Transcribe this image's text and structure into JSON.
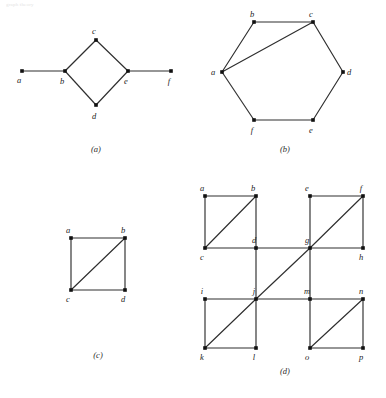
{
  "page": {
    "top_text": "graph theory",
    "background": "#ffffff",
    "edge_color": "#2e2e2e",
    "vertex_color": "#111111",
    "label_color": "#222222"
  },
  "figures": [
    {
      "id": "figure-a",
      "caption": "(a)",
      "type": "undirected-graph",
      "description": "path a-b, diamond b-c-e-d-b, path e-f",
      "vertices": [
        {
          "id": "a",
          "label": "a",
          "x": 22,
          "y": 71,
          "label_dx": -3,
          "label_dy": 12
        },
        {
          "id": "b",
          "label": "b",
          "x": 65,
          "y": 71,
          "label_dx": -3,
          "label_dy": 13
        },
        {
          "id": "c",
          "label": "c",
          "x": 96,
          "y": 40,
          "label_dx": -2,
          "label_dy": -6
        },
        {
          "id": "d",
          "label": "d",
          "x": 96,
          "y": 105,
          "label_dx": -2,
          "label_dy": 14
        },
        {
          "id": "e",
          "label": "e",
          "x": 128,
          "y": 71,
          "label_dx": -2,
          "label_dy": 13
        },
        {
          "id": "f",
          "label": "f",
          "x": 171,
          "y": 71,
          "label_dx": -2,
          "label_dy": 13
        }
      ],
      "edges": [
        [
          "a",
          "b"
        ],
        [
          "b",
          "c"
        ],
        [
          "c",
          "e"
        ],
        [
          "e",
          "d"
        ],
        [
          "d",
          "b"
        ],
        [
          "e",
          "f"
        ]
      ],
      "caption_x": 96,
      "caption_y": 144
    },
    {
      "id": "figure-b",
      "caption": "(b)",
      "type": "undirected-graph",
      "description": "hexagon a-b-c-d-e-f-a with chord a-c",
      "vertices": [
        {
          "id": "a",
          "label": "a",
          "x": 222,
          "y": 72,
          "label_dx": -9,
          "label_dy": 3
        },
        {
          "id": "b",
          "label": "b",
          "x": 254,
          "y": 22,
          "label_dx": -2,
          "label_dy": -5
        },
        {
          "id": "c",
          "label": "c",
          "x": 313,
          "y": 22,
          "label_dx": -2,
          "label_dy": -5
        },
        {
          "id": "d",
          "label": "d",
          "x": 343,
          "y": 72,
          "label_dx": 6,
          "label_dy": 3
        },
        {
          "id": "e",
          "label": "e",
          "x": 313,
          "y": 120,
          "label_dx": -2,
          "label_dy": 13
        },
        {
          "id": "f",
          "label": "f",
          "x": 254,
          "y": 120,
          "label_dx": -2,
          "label_dy": 13
        }
      ],
      "edges": [
        [
          "a",
          "b"
        ],
        [
          "b",
          "c"
        ],
        [
          "c",
          "d"
        ],
        [
          "d",
          "e"
        ],
        [
          "e",
          "f"
        ],
        [
          "f",
          "a"
        ],
        [
          "a",
          "c"
        ]
      ],
      "caption_x": 285,
      "caption_y": 144
    },
    {
      "id": "figure-c",
      "caption": "(c)",
      "type": "undirected-graph",
      "description": "square a-b-d-c with diagonal c-b",
      "vertices": [
        {
          "id": "a",
          "label": "a",
          "x": 71,
          "y": 238,
          "label_dx": -3,
          "label_dy": -5
        },
        {
          "id": "b",
          "label": "b",
          "x": 125,
          "y": 238,
          "label_dx": -2,
          "label_dy": -5
        },
        {
          "id": "c",
          "label": "c",
          "x": 71,
          "y": 290,
          "label_dx": -3,
          "label_dy": 12
        },
        {
          "id": "d",
          "label": "d",
          "x": 125,
          "y": 290,
          "label_dx": -2,
          "label_dy": 12
        }
      ],
      "edges": [
        [
          "a",
          "b"
        ],
        [
          "a",
          "c"
        ],
        [
          "b",
          "d"
        ],
        [
          "c",
          "d"
        ],
        [
          "c",
          "b"
        ]
      ],
      "caption_x": 98,
      "caption_y": 350
    },
    {
      "id": "figure-d",
      "caption": "(d)",
      "type": "undirected-graph",
      "description": "four squares in a 2x2 arrangement, each with a rising diagonal, plus long diagonal k-j-g-f",
      "vertices": [
        {
          "id": "a",
          "label": "a",
          "x": 205,
          "y": 196,
          "label_dx": -3,
          "label_dy": -5
        },
        {
          "id": "b",
          "label": "b",
          "x": 256,
          "y": 196,
          "label_dx": -3,
          "label_dy": -5
        },
        {
          "id": "e",
          "label": "e",
          "x": 310,
          "y": 196,
          "label_dx": -3,
          "label_dy": -5
        },
        {
          "id": "f",
          "label": "f",
          "x": 363,
          "y": 196,
          "label_dx": -2,
          "label_dy": -5
        },
        {
          "id": "c",
          "label": "c",
          "x": 205,
          "y": 248,
          "label_dx": -3,
          "label_dy": 12
        },
        {
          "id": "d",
          "label": "d",
          "x": 256,
          "y": 248,
          "label_dx": -2,
          "label_dy": -5
        },
        {
          "id": "g",
          "label": "g",
          "x": 310,
          "y": 248,
          "label_dx": -3,
          "label_dy": -5
        },
        {
          "id": "h",
          "label": "h",
          "x": 363,
          "y": 248,
          "label_dx": -2,
          "label_dy": 12
        },
        {
          "id": "i",
          "label": "i",
          "x": 205,
          "y": 299,
          "label_dx": -3,
          "label_dy": -5
        },
        {
          "id": "j",
          "label": "j",
          "x": 256,
          "y": 299,
          "label_dx": -2,
          "label_dy": -5
        },
        {
          "id": "m",
          "label": "m",
          "x": 310,
          "y": 299,
          "label_dx": -3,
          "label_dy": -5
        },
        {
          "id": "n",
          "label": "n",
          "x": 363,
          "y": 299,
          "label_dx": -2,
          "label_dy": -5
        },
        {
          "id": "k",
          "label": "k",
          "x": 205,
          "y": 348,
          "label_dx": -3,
          "label_dy": 12
        },
        {
          "id": "l",
          "label": "l",
          "x": 256,
          "y": 348,
          "label_dx": -2,
          "label_dy": 12
        },
        {
          "id": "o",
          "label": "o",
          "x": 310,
          "y": 348,
          "label_dx": -3,
          "label_dy": 12
        },
        {
          "id": "p",
          "label": "p",
          "x": 363,
          "y": 348,
          "label_dx": -2,
          "label_dy": 12
        }
      ],
      "edges": [
        [
          "a",
          "b"
        ],
        [
          "a",
          "c"
        ],
        [
          "b",
          "d"
        ],
        [
          "c",
          "d"
        ],
        [
          "c",
          "b"
        ],
        [
          "e",
          "f"
        ],
        [
          "e",
          "g"
        ],
        [
          "f",
          "h"
        ],
        [
          "g",
          "h"
        ],
        [
          "g",
          "f"
        ],
        [
          "i",
          "j"
        ],
        [
          "i",
          "k"
        ],
        [
          "j",
          "l"
        ],
        [
          "k",
          "l"
        ],
        [
          "k",
          "j"
        ],
        [
          "m",
          "n"
        ],
        [
          "m",
          "o"
        ],
        [
          "n",
          "p"
        ],
        [
          "o",
          "p"
        ],
        [
          "o",
          "n"
        ],
        [
          "d",
          "g"
        ],
        [
          "b",
          "d"
        ],
        [
          "j",
          "m"
        ],
        [
          "d",
          "j"
        ],
        [
          "g",
          "m"
        ],
        [
          "j",
          "g"
        ]
      ],
      "caption_x": 285,
      "caption_y": 366
    }
  ]
}
